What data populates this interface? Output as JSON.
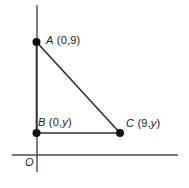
{
  "figure": {
    "type": "geometry-diagram",
    "background_color": "#ffffff",
    "stroke_color": "#3a3a3a",
    "point_color": "#111111",
    "axes": {
      "origin_label": "O",
      "x_axis": {
        "name": "x-axis",
        "from": [
          12,
          155
        ],
        "to": [
          178,
          155
        ]
      },
      "y_axis": {
        "name": "y-axis",
        "from": [
          37,
          5
        ],
        "to": [
          37,
          172
        ]
      }
    },
    "points": [
      {
        "id": "A",
        "label": "A",
        "coords": "(0,9)",
        "x_var": "0",
        "y_var": "9",
        "px": [
          36,
          42
        ]
      },
      {
        "id": "B",
        "label": "B",
        "coords": "(0,y)",
        "x_var": "0",
        "y_var": "y",
        "px": [
          36,
          133
        ]
      },
      {
        "id": "C",
        "label": "C",
        "coords": "(9,y)",
        "x_var": "9",
        "y_var": "y",
        "px": [
          120,
          133
        ]
      }
    ],
    "segments": [
      {
        "name": "segment-AB",
        "from": "A",
        "to": "B"
      },
      {
        "name": "segment-BC",
        "from": "B",
        "to": "C"
      },
      {
        "name": "segment-AC",
        "from": "A",
        "to": "C"
      }
    ],
    "labels": {
      "a": {
        "point": "A",
        "coords": "(0,9)"
      },
      "b": {
        "point": "B",
        "coords": "(0,",
        "var": "y",
        "close": ")"
      },
      "c": {
        "point": "C",
        "coords": "(9,",
        "var": "y",
        "close": ")"
      },
      "origin": "O"
    }
  }
}
